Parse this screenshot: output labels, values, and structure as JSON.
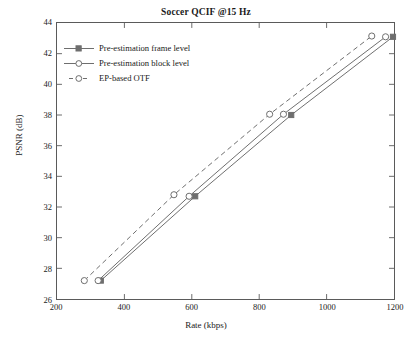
{
  "chart_data": {
    "type": "line",
    "title": "Soccer QCIF @15 Hz",
    "xlabel": "Rate (kbps)",
    "ylabel": "PSNR (dB)",
    "xlim": [
      200,
      1200
    ],
    "ylim": [
      26,
      44
    ],
    "xticks": [
      200,
      400,
      600,
      800,
      1000,
      1200
    ],
    "yticks": [
      26,
      28,
      30,
      32,
      34,
      36,
      38,
      40,
      42,
      44
    ],
    "grid": false,
    "legend_position": "upper left",
    "series": [
      {
        "name": "Pre-estimation frame level",
        "line_style": "solid",
        "marker": "filled-square",
        "color": "#6e6e6e",
        "points": [
          {
            "x": 330,
            "y": 27.2
          },
          {
            "x": 610,
            "y": 32.7
          },
          {
            "x": 895,
            "y": 38.0
          },
          {
            "x": 1197,
            "y": 43.1
          }
        ]
      },
      {
        "name": "Pre-estimation block level",
        "line_style": "solid",
        "marker": "open-circle",
        "color": "#6e6e6e",
        "points": [
          {
            "x": 322,
            "y": 27.2
          },
          {
            "x": 592,
            "y": 32.7
          },
          {
            "x": 872,
            "y": 38.05
          },
          {
            "x": 1175,
            "y": 43.1
          }
        ]
      },
      {
        "name": "EP-based OTF",
        "line_style": "dashed",
        "marker": "open-circle",
        "color": "#6e6e6e",
        "points": [
          {
            "x": 281,
            "y": 27.2
          },
          {
            "x": 547,
            "y": 32.8
          },
          {
            "x": 831,
            "y": 38.05
          },
          {
            "x": 1134,
            "y": 43.15
          }
        ]
      }
    ]
  },
  "legend": {
    "items": [
      {
        "label": "Pre-estimation frame level"
      },
      {
        "label": "Pre-estimation block level"
      },
      {
        "label": "EP-based OTF"
      }
    ]
  }
}
